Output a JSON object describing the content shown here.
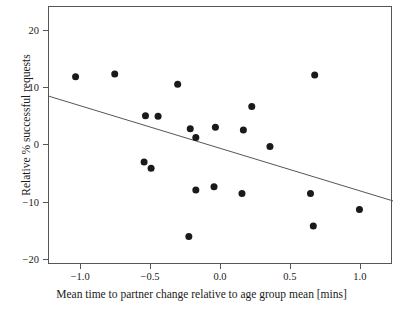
{
  "chart_data": {
    "type": "scatter",
    "title": "",
    "xlabel": "Mean time to partner change relative to age group mean [mins]",
    "ylabel": "Relative % successful requests",
    "xlim": [
      -1.23,
      1.23
    ],
    "ylim": [
      -20.9,
      24.2
    ],
    "grid": false,
    "legend": null,
    "xticks": [
      -1.0,
      -0.5,
      0.0,
      0.5,
      1.0
    ],
    "xticklabels": [
      "-1.0",
      "-0.5",
      "0.0",
      "0.5",
      "1.0"
    ],
    "yticks": [
      20,
      10,
      0,
      -10,
      -20
    ],
    "yticklabels": [
      "20",
      "10",
      "0",
      "-10",
      "-20"
    ],
    "marker_color": "#1a1a1a",
    "marker_size": 7,
    "line_color": "#555555",
    "points": [
      {
        "x": -1.04,
        "y": 12.0
      },
      {
        "x": -0.76,
        "y": 12.5
      },
      {
        "x": -0.54,
        "y": 5.2
      },
      {
        "x": -0.45,
        "y": 5.1
      },
      {
        "x": -0.55,
        "y": -2.9
      },
      {
        "x": -0.5,
        "y": -4.0
      },
      {
        "x": -0.31,
        "y": 10.7
      },
      {
        "x": -0.22,
        "y": 2.9
      },
      {
        "x": -0.18,
        "y": 1.4
      },
      {
        "x": -0.23,
        "y": -15.9
      },
      {
        "x": -0.18,
        "y": -7.8
      },
      {
        "x": -0.05,
        "y": -7.2
      },
      {
        "x": -0.04,
        "y": 3.2
      },
      {
        "x": 0.16,
        "y": 2.7
      },
      {
        "x": 0.15,
        "y": -8.4
      },
      {
        "x": 0.22,
        "y": 6.8
      },
      {
        "x": 0.35,
        "y": -0.2
      },
      {
        "x": 0.67,
        "y": 12.3
      },
      {
        "x": 0.64,
        "y": -8.4
      },
      {
        "x": 0.66,
        "y": -14.1
      },
      {
        "x": 0.99,
        "y": -11.2
      }
    ],
    "trend_line": {
      "x_start": -1.23,
      "y_start": 8.6,
      "x_end": 1.23,
      "y_end": -9.7
    }
  }
}
